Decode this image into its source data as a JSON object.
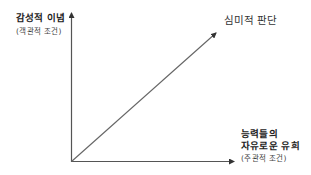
{
  "diagram": {
    "y_axis": {
      "label": "감성적 이념",
      "sublabel": "(객관적 조건)"
    },
    "x_axis": {
      "label_line1": "능력들의",
      "label_line2": "자유로운 유희",
      "sublabel": "(주관적 조건)"
    },
    "diagonal": {
      "label": "심미적 판단"
    },
    "colors": {
      "line": "#555555",
      "text": "#222222"
    }
  }
}
